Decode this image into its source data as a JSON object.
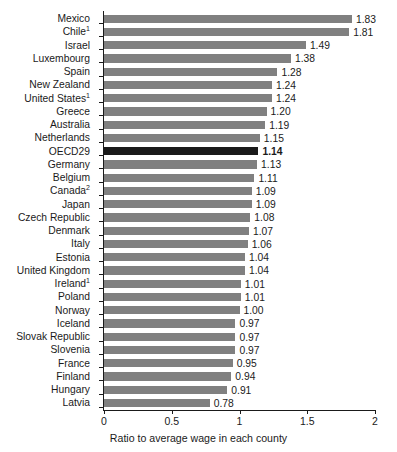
{
  "chart_data": {
    "type": "bar",
    "orientation": "horizontal",
    "title": "",
    "subtitle": "",
    "xlabel": "Ratio to average wage in each county",
    "ylabel": "",
    "xlim": [
      0,
      2
    ],
    "xticks": [
      "0",
      "0.5",
      "1",
      "1.5",
      "2"
    ],
    "xtick_values": [
      0,
      0.5,
      1,
      1.5,
      2
    ],
    "grid": false,
    "legend": null,
    "bar_color": "#808080",
    "highlight_color": "#1a1a1a",
    "highlight_category": "OECD29",
    "categories": [
      "Mexico",
      "Chile",
      "Israel",
      "Luxembourg",
      "Spain",
      "New Zealand",
      "United States",
      "Greece",
      "Australia",
      "Netherlands",
      "OECD29",
      "Germany",
      "Belgium",
      "Canada",
      "Japan",
      "Czech Republic",
      "Denmark",
      "Italy",
      "Estonia",
      "United Kingdom",
      "Ireland",
      "Poland",
      "Norway",
      "Iceland",
      "Slovak Republic",
      "Slovenia",
      "France",
      "Finland",
      "Hungary",
      "Latvia"
    ],
    "category_footnotes": [
      "",
      "1",
      "",
      "",
      "",
      "",
      "1",
      "",
      "",
      "",
      "",
      "",
      "",
      "2",
      "",
      "",
      "",
      "",
      "",
      "",
      "1",
      "",
      "",
      "",
      "",
      "",
      "",
      "",
      "",
      ""
    ],
    "values": [
      1.83,
      1.81,
      1.49,
      1.38,
      1.28,
      1.24,
      1.24,
      1.2,
      1.19,
      1.15,
      1.14,
      1.13,
      1.11,
      1.09,
      1.09,
      1.08,
      1.07,
      1.06,
      1.04,
      1.04,
      1.01,
      1.01,
      1.0,
      0.97,
      0.97,
      0.97,
      0.95,
      0.94,
      0.91,
      0.78
    ],
    "value_labels": [
      "1.83",
      "1.81",
      "1.49",
      "1.38",
      "1.28",
      "1.24",
      "1.24",
      "1.20",
      "1.19",
      "1.15",
      "1.14",
      "1.13",
      "1.11",
      "1.09",
      "1.09",
      "1.08",
      "1.07",
      "1.06",
      "1.04",
      "1.04",
      "1.01",
      "1.01",
      "1.00",
      "0.97",
      "0.97",
      "0.97",
      "0.95",
      "0.94",
      "0.91",
      "0.78"
    ]
  }
}
